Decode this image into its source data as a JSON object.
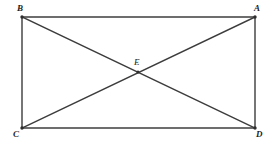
{
  "figure": {
    "type": "geometry-diagram",
    "shape": "rectangle-with-diagonals",
    "background_color": "#ffffff",
    "stroke_color": "#3c3c3c",
    "stroke_width": 1.4,
    "label_color": "#232323",
    "vertices": {
      "B": {
        "label": "B",
        "x": 22,
        "y": 17,
        "position": "top-left"
      },
      "A": {
        "label": "A",
        "x": 255,
        "y": 17,
        "position": "top-right"
      },
      "C": {
        "label": "C",
        "x": 22,
        "y": 128,
        "position": "bottom-left"
      },
      "D": {
        "label": "D",
        "x": 255,
        "y": 128,
        "position": "bottom-right"
      },
      "E": {
        "label": "E",
        "x": 138,
        "y": 72,
        "position": "center-intersection"
      }
    },
    "edges": [
      {
        "name": "top-edge",
        "from": "B",
        "to": "A"
      },
      {
        "name": "right-edge",
        "from": "A",
        "to": "D"
      },
      {
        "name": "bottom-edge",
        "from": "C",
        "to": "D"
      },
      {
        "name": "left-edge",
        "from": "B",
        "to": "C"
      }
    ],
    "diagonals": [
      {
        "name": "diagonal-b-d",
        "from": "B",
        "to": "D"
      },
      {
        "name": "diagonal-a-c",
        "from": "A",
        "to": "C"
      }
    ]
  }
}
